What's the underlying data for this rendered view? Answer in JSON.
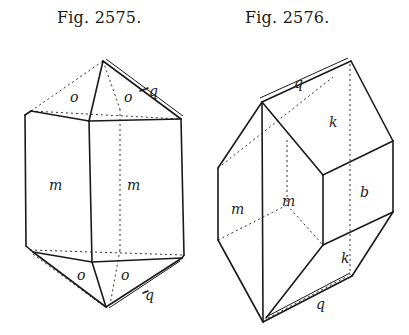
{
  "figures": [
    {
      "caption": "Fig. 2575.",
      "faces": {
        "o1": "o",
        "o2": "o",
        "q_top": "q",
        "m1": "m",
        "m2": "m",
        "o3": "o",
        "o4": "o",
        "q_bottom": "q"
      }
    },
    {
      "caption": "Fig. 2576.",
      "faces": {
        "q_top": "q",
        "k_top": "k",
        "m1": "m",
        "m2": "m",
        "b": "b",
        "k_bottom": "k",
        "q_bottom": "q"
      }
    }
  ]
}
